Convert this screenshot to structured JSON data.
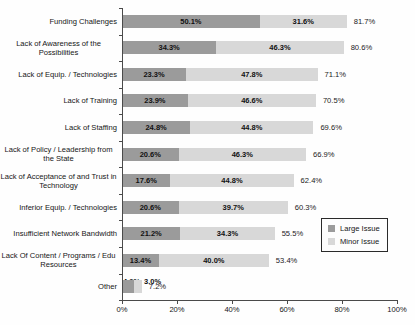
{
  "chart_data": {
    "type": "bar",
    "orientation": "horizontal",
    "stacked": true,
    "title": "",
    "xlabel": "",
    "ylabel": "",
    "xlim": [
      0,
      100
    ],
    "x_ticks": [
      0,
      20,
      40,
      60,
      80,
      100
    ],
    "x_tick_suffix": "%",
    "grid": false,
    "legend_position": "mid-right",
    "categories": [
      "Funding Challenges",
      "Lack of Awareness of the Possibilities",
      "Lack of Equip. / Technologies",
      "Lack of Training",
      "Lack of Staffing",
      "Lack of Policy / Leadership from the State",
      "Lack of Acceptance of and Trust in Technology",
      "Inferior Equip. / Technologies",
      "Insufficient Network Bandwidth",
      "Lack Of Content / Programs / Edu Resources",
      "Other"
    ],
    "series": [
      {
        "name": "Large Issue",
        "color": "#9b9b9b",
        "values": [
          50.1,
          34.3,
          23.3,
          23.9,
          24.8,
          20.6,
          17.6,
          20.6,
          21.2,
          13.4,
          4.2
        ]
      },
      {
        "name": "Minor Issue",
        "color": "#d8d8d8",
        "values": [
          31.6,
          46.3,
          47.8,
          46.6,
          44.8,
          46.3,
          44.8,
          39.7,
          34.3,
          40.0,
          3.0
        ]
      }
    ],
    "totals": [
      81.7,
      80.6,
      71.1,
      70.5,
      69.6,
      66.9,
      62.4,
      60.3,
      55.5,
      53.4,
      7.2
    ],
    "value_suffix": "%",
    "axis_color": "#4a4a4a"
  }
}
